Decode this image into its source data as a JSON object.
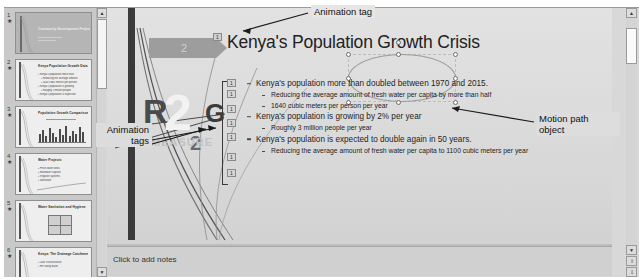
{
  "app": {
    "name": "presentation-editor"
  },
  "thumbnails": {
    "panel_name": "slide-thumbnail-panel",
    "slides": [
      {
        "number": "1",
        "title": "Community Development Projects - Kenya",
        "style": "title",
        "subtitle": ""
      },
      {
        "number": "2",
        "title": "Kenya Population Growth Data",
        "style": "bullets",
        "subtitle": ""
      },
      {
        "number": "3",
        "title": "Population Growth Comparison",
        "style": "chart",
        "subtitle": ""
      },
      {
        "number": "4",
        "title": "Water Projects",
        "style": "bullets",
        "subtitle": ""
      },
      {
        "number": "5",
        "title": "Water Sanitation and Hygiene",
        "style": "grid",
        "subtitle": ""
      },
      {
        "number": "6",
        "title": "Kenya: The Drainage Catchments",
        "style": "bullets",
        "subtitle": ""
      }
    ],
    "scrollbar": {
      "up_label": "▲",
      "down_label": "▼"
    }
  },
  "slide": {
    "shape_badge": "2",
    "title": "Kenya's Population Growth Crisis",
    "title_animation_tag": "1",
    "watermark": {
      "letter_r": "R",
      "big_two": "2",
      "letter_g": "G",
      "small_two": "2",
      "word": "MEASURE"
    },
    "animation_tags": [
      "1",
      "1",
      "1",
      "1",
      "1",
      "1",
      "1"
    ],
    "bullets": [
      {
        "level": 1,
        "text": "Kenya's population more than doubled between 1970 and 2015."
      },
      {
        "level": 2,
        "text": "Reducing the average amount of fresh water per capita by more than half"
      },
      {
        "level": 2,
        "text": "1640 cubic meters per person per year"
      },
      {
        "level": 1,
        "text": "Kenya's population is growing by 2% per year"
      },
      {
        "level": 2,
        "text": "Roughly 3 million people per year"
      },
      {
        "level": 1,
        "text": "Kenya's population is expected to double again in 50 years."
      },
      {
        "level": 2,
        "text": "Reducing the average amount of fresh water per capita to 1100 cubic meters per year"
      }
    ]
  },
  "annotations": [
    {
      "id": "animation-tag",
      "text": "Animation tag"
    },
    {
      "id": "animation-tags",
      "text": "Animation\ntags"
    },
    {
      "id": "motion-path-object",
      "text": "Motion path\nobject"
    }
  ],
  "notes": {
    "placeholder": "Click to add notes"
  },
  "scrollbar": {
    "up_label": "▲",
    "down_label": "▼"
  },
  "colors": {
    "window_bg": "#d8d8d8",
    "slide_bg": "#dcdcdc",
    "panel_bg": "#c9c9c9",
    "accent_gray": "#9d9d9d",
    "dark_bar": "#3a3a3a",
    "text": "#1e1e1e"
  }
}
